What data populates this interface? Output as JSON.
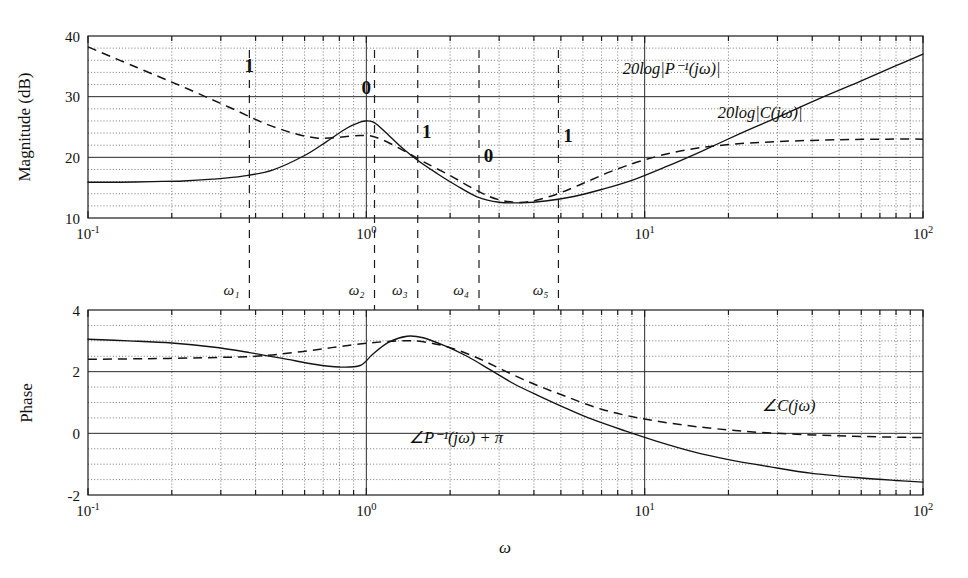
{
  "figure": {
    "kind": "bode-plot",
    "background": "#ffffff",
    "ink": "#141414"
  },
  "chart_data": [
    {
      "type": "line",
      "id": "magnitude-plot",
      "title": "",
      "xlabel": "",
      "ylabel": "Magnitude (dB)",
      "xscale": "log",
      "xlim": [
        0.1,
        100
      ],
      "ylim": [
        10,
        40
      ],
      "yticks": [
        10,
        20,
        30,
        40
      ],
      "ytick_labels": [
        "10",
        "20",
        "30",
        "40"
      ],
      "xticks": [
        0.1,
        1,
        10,
        100
      ],
      "xtick_labels": [
        "10-1",
        "100",
        "101",
        "102"
      ],
      "grid": "log-minor-dotted",
      "series": [
        {
          "name": "20log|P-1(jw)|",
          "style": "solid",
          "x": [
            0.1,
            0.13,
            0.17,
            0.22,
            0.28,
            0.36,
            0.46,
            0.6,
            0.72,
            0.85,
            0.95,
            1.0,
            1.05,
            1.1,
            1.2,
            1.35,
            1.55,
            1.8,
            2.1,
            2.5,
            3.0,
            3.6,
            4.4,
            5.5,
            7.0,
            9.0,
            12,
            16,
            22,
            30,
            42,
            60,
            80,
            100
          ],
          "y": [
            15.9,
            15.9,
            16.0,
            16.1,
            16.4,
            16.9,
            17.9,
            20.3,
            22.6,
            24.8,
            25.8,
            26.0,
            25.9,
            25.3,
            23.7,
            21.5,
            19.3,
            17.3,
            15.4,
            13.5,
            12.6,
            12.5,
            12.8,
            13.5,
            14.7,
            16.2,
            18.5,
            21.0,
            23.9,
            26.6,
            29.6,
            32.6,
            35.1,
            37.0
          ]
        },
        {
          "name": "20log|C(jw)|",
          "style": "dashed",
          "x": [
            0.1,
            0.15,
            0.22,
            0.32,
            0.46,
            0.66,
            0.95,
            1.1,
            1.35,
            1.6,
            2.0,
            2.5,
            3.0,
            3.7,
            4.6,
            5.8,
            7.5,
            10,
            14,
            20,
            30,
            50,
            75,
            100
          ],
          "y": [
            38.2,
            34.8,
            31.6,
            28.3,
            25.1,
            23.2,
            23.6,
            23.2,
            21.2,
            19.3,
            17.0,
            14.5,
            13.0,
            12.6,
            13.6,
            15.4,
            17.6,
            19.6,
            21.2,
            22.1,
            22.6,
            22.9,
            23.0,
            23.0
          ]
        }
      ],
      "annotations": [
        {
          "text": "1",
          "x": 0.38,
          "y": 34.0,
          "role": "slope-label"
        },
        {
          "text": "0",
          "x": 1.0,
          "y": 30.4,
          "role": "slope-label"
        },
        {
          "text": "1",
          "x": 1.65,
          "y": 23.2,
          "role": "slope-label"
        },
        {
          "text": "0",
          "x": 2.75,
          "y": 19.3,
          "role": "slope-label"
        },
        {
          "text": "1",
          "x": 5.3,
          "y": 22.5,
          "role": "slope-label"
        },
        {
          "text": "20log|P-1(jw)|",
          "x": 12.5,
          "y": 33.8,
          "role": "curve-label"
        },
        {
          "text": "20log|C(jw)|",
          "x": 26.0,
          "y": 26.5,
          "role": "curve-label"
        }
      ]
    },
    {
      "type": "line",
      "id": "phase-plot",
      "title": "",
      "xlabel": "w",
      "ylabel": "Phase",
      "xscale": "log",
      "xlim": [
        0.1,
        100
      ],
      "ylim": [
        -2,
        4
      ],
      "yticks": [
        -2,
        0,
        2,
        4
      ],
      "ytick_labels": [
        "-2",
        "0",
        "2",
        "4"
      ],
      "xticks": [
        0.1,
        1,
        10,
        100
      ],
      "xtick_labels": [
        "10-1",
        "100",
        "101",
        "102"
      ],
      "grid": "log-minor-dotted",
      "series": [
        {
          "name": "angle P-1(jw) + pi",
          "style": "solid",
          "x": [
            0.1,
            0.14,
            0.2,
            0.28,
            0.38,
            0.5,
            0.65,
            0.8,
            0.95,
            1.05,
            1.2,
            1.4,
            1.6,
            1.9,
            2.3,
            2.8,
            3.4,
            4.2,
            5.2,
            6.5,
            8.5,
            11,
            15,
            20,
            28,
            40,
            60,
            80,
            100
          ],
          "y": [
            3.05,
            3.0,
            2.93,
            2.8,
            2.62,
            2.43,
            2.24,
            2.15,
            2.2,
            2.55,
            2.95,
            3.15,
            3.1,
            2.85,
            2.5,
            2.05,
            1.6,
            1.2,
            0.82,
            0.45,
            0.08,
            -0.25,
            -0.6,
            -0.85,
            -1.08,
            -1.3,
            -1.45,
            -1.53,
            -1.58
          ]
        },
        {
          "name": "angle C(jw)",
          "style": "dashed",
          "x": [
            0.1,
            0.16,
            0.26,
            0.4,
            0.55,
            0.75,
            1.0,
            1.3,
            1.6,
            2.0,
            2.5,
            3.1,
            4.0,
            5.2,
            7.0,
            9.5,
            13,
            18,
            26,
            40,
            60,
            100
          ],
          "y": [
            2.4,
            2.42,
            2.45,
            2.5,
            2.62,
            2.78,
            2.92,
            3.0,
            2.97,
            2.78,
            2.45,
            2.05,
            1.6,
            1.2,
            0.78,
            0.5,
            0.3,
            0.15,
            0.03,
            -0.05,
            -0.1,
            -0.14
          ]
        }
      ],
      "annotations": [
        {
          "text": "angle C(jw)",
          "x": 33.0,
          "y": 0.72,
          "role": "curve-label"
        },
        {
          "text": "angle P-1(jw) + pi",
          "x": 2.1,
          "y": -0.32,
          "role": "curve-label"
        }
      ]
    }
  ],
  "omega_markers": [
    {
      "label": "w1",
      "sub": "1",
      "omega": 0.38
    },
    {
      "label": "w2",
      "sub": "2",
      "omega": 1.07
    },
    {
      "label": "w3",
      "sub": "3",
      "omega": 1.53
    },
    {
      "label": "w4",
      "sub": "4",
      "omega": 2.54
    },
    {
      "label": "w5",
      "sub": "5",
      "omega": 4.9
    }
  ],
  "labels": {
    "mag_ylabel": "Magnitude (dB)",
    "phase_ylabel": "Phase",
    "x_axis_label": "ω",
    "mag_yticks": [
      "10",
      "20",
      "30",
      "40"
    ],
    "phase_yticks": [
      "-2",
      "0",
      "2",
      "4"
    ],
    "xtick_mantissa": "10",
    "xtick_exps": [
      "-1",
      "0",
      "1",
      "2"
    ],
    "slope_1": "1",
    "slope_0": "0",
    "curve_pinv_mag": "20log|P⁻¹(jω)|",
    "curve_c_mag": "20log|C(jω)|",
    "curve_c_phase": "∠C(jω)",
    "curve_pinv_phase": "∠P⁻¹(jω) + π",
    "omega_names": [
      "ω₁",
      "ω₂",
      "ω₃",
      "ω₄",
      "ω₅"
    ]
  }
}
